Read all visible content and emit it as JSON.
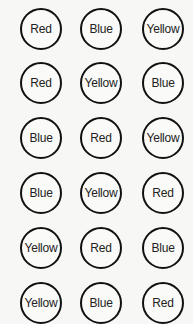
{
  "grid": {
    "rows": [
      [
        "Red",
        "Blue",
        "Yellow"
      ],
      [
        "Red",
        "Yellow",
        "Blue"
      ],
      [
        "Blue",
        "Red",
        "Yellow"
      ],
      [
        "Blue",
        "Yellow",
        "Red"
      ],
      [
        "Yellow",
        "Red",
        "Blue"
      ],
      [
        "Yellow",
        "Blue",
        "Red"
      ]
    ]
  }
}
